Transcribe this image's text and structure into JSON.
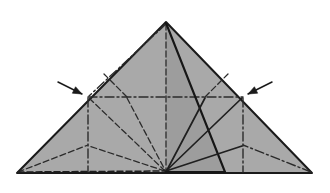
{
  "diagram": {
    "type": "origami-crease-pattern",
    "canvas": {
      "width": 330,
      "height": 193
    },
    "colors": {
      "background": "#ffffff",
      "paper_fill": "#a9a9a9",
      "paper_fill_shadow": "#9d9d9d",
      "outline": "#1a1a1a",
      "crease_line": "#2b2b2b",
      "arrow": "#1a1a1a"
    },
    "line_styles": {
      "outline": {
        "name": "solid-edge",
        "width": 2.0,
        "dash": "none"
      },
      "valley": {
        "name": "dashed-valley-fold",
        "width": 1.3,
        "dash": "6,3"
      },
      "mountain": {
        "name": "dash-dot-mountain-fold",
        "width": 1.3,
        "dash": "9,3,2,3"
      },
      "fold_edge": {
        "name": "solid-fold-edge",
        "width": 2.0,
        "dash": "none"
      }
    },
    "key_points": {
      "apex": {
        "label": "apex",
        "x": 166,
        "y": 22
      },
      "left_corner": {
        "label": "left-corner",
        "x": 17,
        "y": 173
      },
      "right_corner": {
        "label": "right-corner",
        "x": 312,
        "y": 173
      },
      "bottom_center": {
        "label": "bottom-center",
        "x": 166,
        "y": 172
      },
      "left_mid_edge": {
        "label": "left-mid-edge",
        "x": 88,
        "y": 97
      },
      "right_mid_edge": {
        "label": "right-mid-edge",
        "x": 243,
        "y": 97
      },
      "flap_tip": {
        "label": "flap-corner",
        "x": 225,
        "y": 172
      },
      "left_low_node": {
        "label": "left-lower-node",
        "x": 88,
        "y": 145
      },
      "right_low_node": {
        "label": "right-lower-node",
        "x": 243,
        "y": 145
      },
      "left_upper_node": {
        "label": "left-upper-node",
        "x": 127,
        "y": 97
      },
      "right_upper_node": {
        "label": "right-upper-node",
        "x": 205,
        "y": 97
      }
    },
    "outline_polygon": "166,22 312,173 17,173",
    "creases": [
      {
        "id": "center-vertical",
        "style": "valley",
        "from": "apex",
        "to": "bottom_center",
        "d": "M166,24 L166,171"
      },
      {
        "id": "horizontal-midline",
        "style": "mountain",
        "from": "left_mid_edge",
        "to": "right_mid_edge",
        "d": "M88,97 L243,97"
      },
      {
        "id": "apex-to-left-mid",
        "style": "mountain",
        "from": "apex",
        "to": "left_mid_edge",
        "d": "M166,24 L89,96"
      },
      {
        "id": "apex-to-right-flap",
        "style": "fold_edge",
        "from": "apex",
        "to": "flap_tip",
        "d": "M166,23 L225,172"
      },
      {
        "id": "left-vertical-drop",
        "style": "mountain",
        "from": "left_mid_edge",
        "to": "baseline",
        "d": "M88,98 L88,172"
      },
      {
        "id": "right-vertical-drop",
        "style": "mountain",
        "from": "right_mid_edge",
        "to": "baseline",
        "d": "M243,98 L243,172"
      },
      {
        "id": "bottomcenter-to-left-mid",
        "style": "valley",
        "from": "bottom_center",
        "to": "left_mid_edge",
        "d": "M165,171 L89,98"
      },
      {
        "id": "bottomcenter-to-right-mid",
        "style": "fold_edge",
        "from": "bottom_center",
        "to": "right_mid_edge",
        "d": "M166,171 L242,98"
      },
      {
        "id": "bottomcenter-to-left-lower",
        "style": "valley",
        "from": "bottom_center",
        "to": "left_low_node",
        "d": "M165,171 L89,146"
      },
      {
        "id": "bottomcenter-to-right-lower",
        "style": "fold_edge",
        "from": "bottom_center",
        "to": "right_low_node",
        "d": "M166,171 L242,146"
      },
      {
        "id": "left-corner-to-left-lower",
        "style": "valley",
        "from": "left_corner",
        "to": "left_low_node",
        "d": "M18,172 L88,145"
      },
      {
        "id": "right-corner-to-right-lower",
        "style": "mountain",
        "from": "right_corner",
        "to": "right_low_node",
        "d": "M311,172 L243,145"
      },
      {
        "id": "left-corner-to-bottomcenter",
        "style": "valley",
        "from": "left_corner",
        "to": "bottom_center",
        "d": "M18,172 L165,171"
      },
      {
        "id": "left-upper-diagonal",
        "style": "valley",
        "from": "left_upper_node",
        "to": "left-edge",
        "d": "M127,97 L104,74"
      },
      {
        "id": "right-upper-diagonal",
        "style": "valley",
        "from": "right_upper_node",
        "to": "right-edge",
        "d": "M205,97 L228,74"
      },
      {
        "id": "left-upper-node-to-bottomcenter",
        "style": "valley",
        "from": "left_upper_node",
        "to": "bottom_center",
        "d": "M127,98 L165,170"
      },
      {
        "id": "right-upper-node-to-bottomcenter",
        "style": "fold_edge",
        "from": "right_upper_node",
        "to": "bottom_center",
        "d": "M205,98 L167,170"
      },
      {
        "id": "flap-base-edge",
        "style": "fold_edge",
        "from": "bottom_center",
        "to": "flap_tip",
        "d": "M166,172 L225,172"
      }
    ],
    "arrows": [
      {
        "id": "arrow-left",
        "label": "left-push-arrow",
        "direction": "down-right",
        "tail_x": 58,
        "tail_y": 82,
        "tip_x": 82,
        "tip_y": 94
      },
      {
        "id": "arrow-right",
        "label": "right-push-arrow",
        "direction": "down-left",
        "tail_x": 272,
        "tail_y": 82,
        "tip_x": 248,
        "tip_y": 94
      }
    ]
  }
}
